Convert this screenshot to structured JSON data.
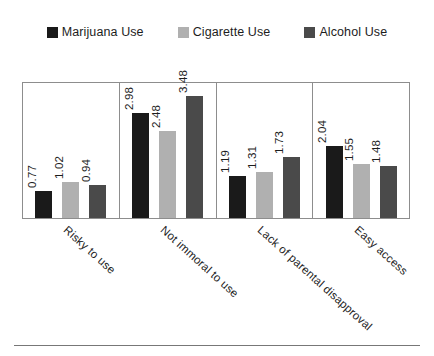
{
  "chart_data": {
    "type": "bar",
    "title": "",
    "subtitle": "",
    "xlabel": "",
    "ylabel": "",
    "ylim": [
      0,
      3.9
    ],
    "grid": false,
    "legend_position": "top-center",
    "categories": [
      "Risky to use",
      "Not immoral to use",
      "Lack of parental disapproval",
      "Easy access"
    ],
    "series": [
      {
        "name": "Marijuana Use",
        "color": "#1a1a1a",
        "values": [
          0.77,
          2.98,
          1.19,
          2.04
        ],
        "labels": [
          "0.77",
          "2.98",
          "1.19",
          "2.04"
        ]
      },
      {
        "name": "Cigarette Use",
        "color": "#b0b0b0",
        "values": [
          1.02,
          2.48,
          1.31,
          1.55
        ],
        "labels": [
          "1.02",
          "2.48",
          "1.31",
          "1.55"
        ]
      },
      {
        "name": "Alcohol Use",
        "color": "#4a4a4a",
        "values": [
          0.94,
          3.48,
          1.73,
          1.48
        ],
        "labels": [
          "0.94",
          "3.48",
          "1.73",
          "1.48"
        ]
      }
    ],
    "annotations": []
  },
  "legend": {
    "items": [
      {
        "label": "Marijuana Use",
        "color": "#1a1a1a",
        "swatch_icon": "square-swatch-icon"
      },
      {
        "label": "Cigarette Use",
        "color": "#b0b0b0",
        "swatch_icon": "square-swatch-icon"
      },
      {
        "label": "Alcohol Use",
        "color": "#4a4a4a",
        "swatch_icon": "square-swatch-icon"
      }
    ]
  },
  "axis": {
    "frame_color": "#8d8d8d",
    "rule_color": "#777777"
  }
}
